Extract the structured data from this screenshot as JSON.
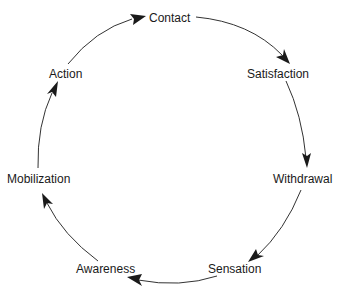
{
  "diagram": {
    "nodes": [
      {
        "id": "contact",
        "label": "Contact"
      },
      {
        "id": "satisfaction",
        "label": "Satisfaction"
      },
      {
        "id": "withdrawal",
        "label": "Withdrawal"
      },
      {
        "id": "sensation",
        "label": "Sensation"
      },
      {
        "id": "awareness",
        "label": "Awareness"
      },
      {
        "id": "mobilization",
        "label": "Mobilization"
      },
      {
        "id": "action",
        "label": "Action"
      }
    ],
    "edges": [
      {
        "from": "contact",
        "to": "satisfaction"
      },
      {
        "from": "satisfaction",
        "to": "withdrawal"
      },
      {
        "from": "withdrawal",
        "to": "sensation"
      },
      {
        "from": "sensation",
        "to": "awareness"
      },
      {
        "from": "awareness",
        "to": "mobilization"
      },
      {
        "from": "mobilization",
        "to": "action"
      },
      {
        "from": "action",
        "to": "contact"
      }
    ],
    "colors": {
      "line": "#333333",
      "text": "#1a1a1a",
      "background": "#ffffff"
    }
  }
}
